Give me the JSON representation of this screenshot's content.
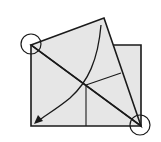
{
  "diagram": {
    "type": "origami-fold-step",
    "colors": {
      "paper": "#e6e6e6",
      "line": "#1a1a1a",
      "background": "#ffffff"
    },
    "markers": [
      {
        "name": "corner-circle-top-left",
        "cx": 31,
        "cy": 44,
        "r": 10
      },
      {
        "name": "corner-circle-bottom-right",
        "cx": 140,
        "cy": 125,
        "r": 10
      }
    ],
    "arrow": {
      "direction": "fold-down-left"
    }
  }
}
